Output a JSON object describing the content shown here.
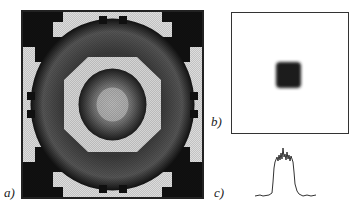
{
  "labels": {
    "a": "a)",
    "b": "b)",
    "c": "c)"
  },
  "panels": [
    {
      "id": "a",
      "description": "grayscale intensity pattern with concentric octagonal rings and dark corner blobs"
    },
    {
      "id": "b",
      "description": "white field with a small dark square spot at center"
    },
    {
      "id": "c",
      "description": "1D intensity profile: flat-topped peak with ripples"
    }
  ],
  "colors": {
    "ink": "#222222",
    "background": "#ffffff",
    "mid_gray": "#888888",
    "light_gray": "#d8d8d8"
  }
}
